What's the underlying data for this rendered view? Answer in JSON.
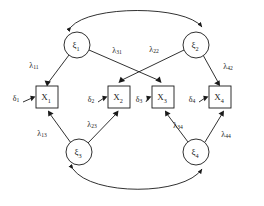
{
  "diagram": {
    "type": "structural-equation-model-path-diagram",
    "title": "",
    "background_color": "#ffffff",
    "stroke_color": "#1a1a1a",
    "latent_variables": [
      {
        "id": "xi1",
        "symbol": "ξ",
        "subscript": "1",
        "shape": "circle",
        "cx": 77,
        "cy": 45,
        "r": 13
      },
      {
        "id": "xi2",
        "symbol": "ξ",
        "subscript": "2",
        "shape": "circle",
        "cx": 196,
        "cy": 45,
        "r": 13
      },
      {
        "id": "xi3",
        "symbol": "ξ",
        "subscript": "3",
        "shape": "circle",
        "cx": 79,
        "cy": 152,
        "r": 13
      },
      {
        "id": "xi4",
        "symbol": "ξ",
        "subscript": "4",
        "shape": "circle",
        "cx": 196,
        "cy": 152,
        "r": 13
      }
    ],
    "observed_variables": [
      {
        "id": "x1",
        "symbol": "X",
        "subscript": "1",
        "shape": "rect",
        "x": 36,
        "y": 86,
        "w": 22,
        "h": 22
      },
      {
        "id": "x2",
        "symbol": "X",
        "subscript": "2",
        "shape": "rect",
        "x": 108,
        "y": 86,
        "w": 22,
        "h": 22
      },
      {
        "id": "x3",
        "symbol": "X",
        "subscript": "3",
        "shape": "rect",
        "x": 152,
        "y": 86,
        "w": 22,
        "h": 22
      },
      {
        "id": "x4",
        "symbol": "X",
        "subscript": "4",
        "shape": "rect",
        "x": 209,
        "y": 86,
        "w": 22,
        "h": 22
      }
    ],
    "error_terms": [
      {
        "id": "d1",
        "symbol": "δ",
        "subscript": "1",
        "x": 16,
        "y": 98,
        "target": "x1"
      },
      {
        "id": "d2",
        "symbol": "δ",
        "subscript": "2",
        "x": 91,
        "y": 99,
        "target": "x2"
      },
      {
        "id": "d3",
        "symbol": "δ",
        "subscript": "3",
        "x": 139,
        "y": 99,
        "target": "x3"
      },
      {
        "id": "d4",
        "symbol": "δ",
        "subscript": "4",
        "x": 192,
        "y": 99,
        "target": "x4"
      }
    ],
    "loadings": [
      {
        "id": "l11",
        "symbol": "λ",
        "subscript": "11",
        "from": "xi1",
        "to": "x1",
        "label_x": 34,
        "label_y": 65
      },
      {
        "id": "l31",
        "symbol": "λ",
        "subscript": "31",
        "from": "xi1",
        "to": "x3",
        "label_x": 117,
        "label_y": 50
      },
      {
        "id": "l22",
        "symbol": "λ",
        "subscript": "22",
        "from": "xi2",
        "to": "x2",
        "label_x": 154,
        "label_y": 49
      },
      {
        "id": "l42",
        "symbol": "λ",
        "subscript": "42",
        "from": "xi2",
        "to": "x4",
        "label_x": 228,
        "label_y": 66
      },
      {
        "id": "l13",
        "symbol": "λ",
        "subscript": "13",
        "from": "xi3",
        "to": "x1",
        "label_x": 42,
        "label_y": 133
      },
      {
        "id": "l23",
        "symbol": "λ",
        "subscript": "23",
        "from": "xi3",
        "to": "x2",
        "label_x": 92,
        "label_y": 124
      },
      {
        "id": "l34",
        "symbol": "λ",
        "subscript": "34",
        "from": "xi4",
        "to": "x3",
        "label_x": 178,
        "label_y": 125
      },
      {
        "id": "l44",
        "symbol": "λ",
        "subscript": "44",
        "from": "xi4",
        "to": "x4",
        "label_x": 226,
        "label_y": 134
      }
    ],
    "correlations": [
      {
        "id": "corr-top",
        "between": [
          "xi1",
          "xi2"
        ],
        "style": "double-headed-arc",
        "position": "top"
      },
      {
        "id": "corr-bottom",
        "between": [
          "xi3",
          "xi4"
        ],
        "style": "double-headed-arc",
        "position": "bottom"
      }
    ]
  }
}
